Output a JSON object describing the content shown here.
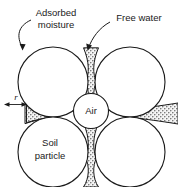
{
  "figure": {
    "type": "diagram",
    "background_color": "#ffffff",
    "line_color": "#1a1a1a",
    "water_fill_color": "#b8b8b8"
  },
  "labels": {
    "adsorbed_moisture_line1": "Adsorbed",
    "adsorbed_moisture_line2": "moisture",
    "free_water": "Free water",
    "air": "Air",
    "soil_particle_line1": "Soil",
    "soil_particle_line2": "particle",
    "radius": "r"
  },
  "elements": {
    "particles": [
      {
        "name": "top-left-particle",
        "cx": 53,
        "cy": 82,
        "r": 35
      },
      {
        "name": "top-right-particle",
        "cx": 130,
        "cy": 82,
        "r": 35
      },
      {
        "name": "bottom-left-particle",
        "cx": 53,
        "cy": 152,
        "r": 35
      },
      {
        "name": "bottom-right-particle",
        "cx": 130,
        "cy": 152,
        "r": 35
      }
    ],
    "air_void": {
      "name": "air-void-circle",
      "cx": 91,
      "cy": 110,
      "r": 18
    },
    "water_bridges": [
      "top-vertical-bridge",
      "left-horizontal-bridge",
      "right-horizontal-bridge",
      "bottom-vertical-bridge"
    ]
  }
}
